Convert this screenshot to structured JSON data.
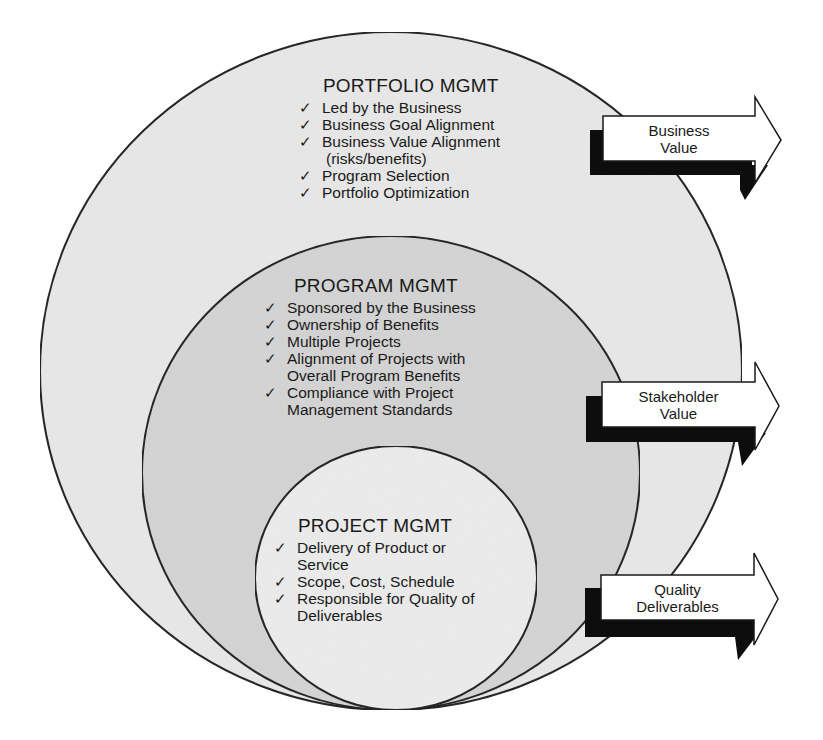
{
  "diagram": {
    "colors": {
      "outer_fill": "#e9e9e9",
      "middle_fill": "#d6d6d6",
      "inner_fill": "#ededed",
      "stroke": "#2a2a2a",
      "arrow_fill": "#ffffff",
      "arrow_shadow": "#0d0d0d"
    },
    "portfolio": {
      "title": "PORTFOLIO MGMT",
      "items": [
        {
          "text": "Led by the Business",
          "cont": ""
        },
        {
          "text": "Business Goal Alignment",
          "cont": ""
        },
        {
          "text": "Business Value Alignment",
          "cont": "(risks/benefits)"
        },
        {
          "text": "Program Selection",
          "cont": ""
        },
        {
          "text": "Portfolio Optimization",
          "cont": ""
        }
      ]
    },
    "program": {
      "title": "PROGRAM MGMT",
      "items": [
        {
          "text": "Sponsored by the Business",
          "cont": ""
        },
        {
          "text": "Ownership of Benefits",
          "cont": ""
        },
        {
          "text": "Multiple Projects",
          "cont": ""
        },
        {
          "text": "Alignment of Projects with",
          "cont": "Overall Program Benefits"
        },
        {
          "text": "Compliance with Project",
          "cont": "Management Standards"
        }
      ]
    },
    "project": {
      "title": "PROJECT MGMT",
      "items": [
        {
          "text": "Delivery of Product or",
          "cont": "Service"
        },
        {
          "text": "Scope, Cost, Schedule",
          "cont": ""
        },
        {
          "text": "Responsible for Quality of",
          "cont": "Deliverables"
        }
      ]
    },
    "check_glyph": "✓",
    "arrows": [
      {
        "line1": "Business",
        "line2": "Value"
      },
      {
        "line1": "Stakeholder",
        "line2": "Value"
      },
      {
        "line1": "Quality",
        "line2": "Deliverables"
      }
    ]
  }
}
